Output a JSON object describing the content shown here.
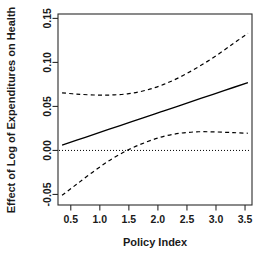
{
  "chart_data": {
    "type": "line",
    "title": "",
    "xlabel": "Policy Index",
    "ylabel": "Effect of Log of Expenditures on Health",
    "xlim": [
      0.28,
      3.62
    ],
    "ylim": [
      -0.062,
      0.155
    ],
    "xticks": [
      0.5,
      1.0,
      1.5,
      2.0,
      2.5,
      3.0,
      3.5
    ],
    "xticklabels": [
      "0.5",
      "1.0",
      "1.5",
      "2.0",
      "2.5",
      "3.0",
      "3.5"
    ],
    "yticks": [
      -0.05,
      0.0,
      0.05,
      0.1,
      0.15
    ],
    "yticklabels": [
      "-0.05",
      "0.00",
      "0.05",
      "0.10",
      "0.15"
    ],
    "grid": false,
    "legend": "none",
    "box": true,
    "reference_line": {
      "name": "zero-reference",
      "orientation": "horizontal",
      "y": 0.0,
      "style": "dotted",
      "color": "#000000"
    },
    "series": [
      {
        "name": "Marginal Effect",
        "style": "solid",
        "color": "#000000",
        "x": [
          0.35,
          0.75,
          1.15,
          1.55,
          1.95,
          2.35,
          2.75,
          3.15,
          3.55
        ],
        "values": [
          0.006,
          0.0149,
          0.0238,
          0.0327,
          0.0416,
          0.0504,
          0.0593,
          0.0682,
          0.0771
        ]
      },
      {
        "name": "Upper 95% Confidence Bound",
        "style": "dashed",
        "color": "#000000",
        "x": [
          0.35,
          0.6,
          0.9,
          1.2,
          1.5,
          1.8,
          2.1,
          2.4,
          2.7,
          3.0,
          3.3,
          3.55
        ],
        "values": [
          0.0655,
          0.064,
          0.063,
          0.063,
          0.0645,
          0.0685,
          0.075,
          0.084,
          0.095,
          0.1075,
          0.1215,
          0.133
        ]
      },
      {
        "name": "Lower 95% Confidence Bound",
        "style": "dashed",
        "color": "#000000",
        "x": [
          0.35,
          0.6,
          0.9,
          1.2,
          1.5,
          1.8,
          2.1,
          2.4,
          2.7,
          3.0,
          3.3,
          3.55
        ],
        "values": [
          -0.051,
          -0.0385,
          -0.0235,
          -0.01,
          0.001,
          0.0095,
          0.016,
          0.0197,
          0.0212,
          0.021,
          0.0202,
          0.0195
        ]
      }
    ],
    "annotations": {
      "zero_crossing_lower_bound_x": 1.45
    }
  }
}
